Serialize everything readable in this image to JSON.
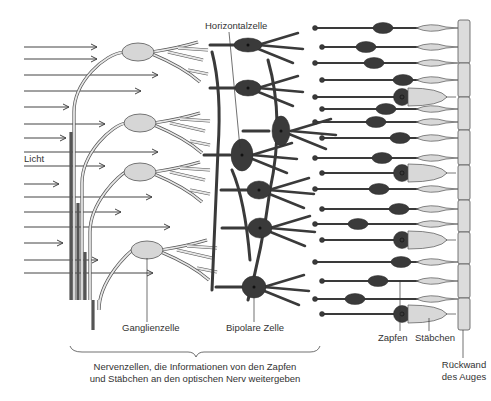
{
  "labels": {
    "horizontal_cell": "Horizontalzelle",
    "light": "Licht",
    "ganglion_cell": "Ganglienzelle",
    "bipolar_cell": "Bipolare Zelle",
    "cones": "Zapfen",
    "rods": "Stäbchen",
    "back_wall_line1": "Rückwand",
    "back_wall_line2": "des Auges",
    "caption_line1": "Nervenzellen, die Informationen von den Zapfen",
    "caption_line2": "und Stäbchen an den optischen Nerv weitergeben"
  },
  "light_arrows": {
    "count": 15,
    "direction": "right"
  },
  "cells": {
    "ganglion_cells": 4,
    "horizontal_cells": 2,
    "bipolar_cells": 5,
    "photoreceptor_rows": 18,
    "cone_rows": [
      4,
      9,
      13,
      17
    ],
    "back_wall_segments": 9
  },
  "colors": {
    "ink": "#333333",
    "ganglion_fill": "#d6d6d6",
    "dark_cell": "#3a3a3a",
    "outer_segment": "#d8d8d8"
  }
}
